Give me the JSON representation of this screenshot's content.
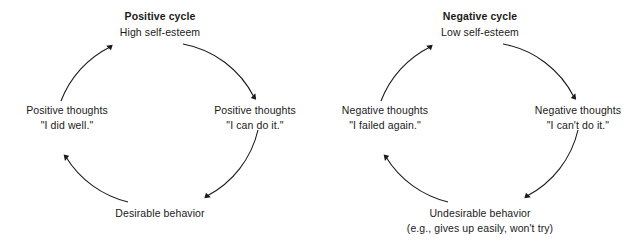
{
  "canvas": {
    "background": "#ffffff",
    "ink": "#1a1a1a"
  },
  "diagrams": [
    {
      "id": "positive-cycle",
      "title": "Positive cycle",
      "nodes": {
        "top": {
          "line1": "High self-esteem",
          "line2": ""
        },
        "right": {
          "line1": "Positive thoughts",
          "line2": "\"I can do it.\""
        },
        "bottom": {
          "line1": "Desirable behavior",
          "line2": ""
        },
        "left": {
          "line1": "Positive thoughts",
          "line2": "\"I did well.\""
        }
      }
    },
    {
      "id": "negative-cycle",
      "title": "Negative cycle",
      "nodes": {
        "top": {
          "line1": "Low self-esteem",
          "line2": ""
        },
        "right": {
          "line1": "Negative thoughts",
          "line2": "\"I can't do it.\""
        },
        "bottom": {
          "line1": "Undesirable behavior",
          "line2": "(e.g., gives up easily, won't try)"
        },
        "left": {
          "line1": "Negative thoughts",
          "line2": "\"I failed again.\""
        }
      }
    }
  ]
}
